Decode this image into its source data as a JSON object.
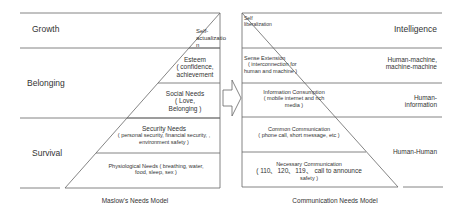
{
  "left": {
    "title": "Maslow's Needs Model",
    "categories": {
      "growth": "Growth",
      "belonging": "Belonging",
      "survival": "Survival"
    },
    "levels": [
      {
        "name": "Self-actualization",
        "line1": "Self-",
        "line2": "actualizatio",
        "line3": "n"
      },
      {
        "name": "Esteem",
        "line1": "Esteem",
        "line2": "( confidence,",
        "line3": "achievement"
      },
      {
        "name": "Social Needs",
        "line1": "Social Needs",
        "line2": "( Love,",
        "line3": "Belonging )"
      },
      {
        "name": "Security Needs",
        "line1": "Security Needs",
        "line2": "( personal security, financial security, ,",
        "line3": "environment safety )"
      },
      {
        "name": "Physiological Needs",
        "line1": "Physiological Needs ( breathing, water,",
        "line2": "food, sleep, sex )"
      }
    ]
  },
  "right": {
    "title": "Communication Needs Model",
    "categories": {
      "intelligence": "Intelligence",
      "hm": "Human-machine,",
      "mm": "machine-machine",
      "hi1": "Human-",
      "hi2": "information",
      "hh": "Human-Human"
    },
    "levels": [
      {
        "line1": "Self",
        "line2": "liberalization"
      },
      {
        "line1": "Sense Extension",
        "line2": "( interconnection for",
        "line3": "human and machine )"
      },
      {
        "line1": "Information Consumption",
        "line2": "( mobile internet and rich",
        "line3": "media )"
      },
      {
        "line1": "Common Communication",
        "line2": "( phone call, short message, etc )"
      },
      {
        "line1": "Necessary Communication",
        "line2": "( 110、120、119、 call to announce",
        "line3": "safety )"
      }
    ]
  },
  "arrow": {
    "icon": "right-arrow-icon"
  }
}
